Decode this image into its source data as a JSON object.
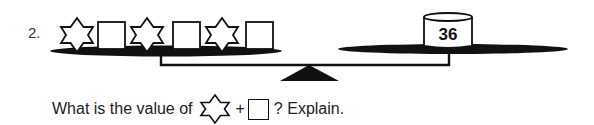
{
  "problem": {
    "number": "2.",
    "left_pan": {
      "items": [
        "star",
        "square",
        "star",
        "square",
        "star",
        "square"
      ]
    },
    "right_pan": {
      "cylinder_label": "36"
    },
    "question": {
      "prefix": "What is the value of",
      "plus": "+",
      "suffix": "? Explain."
    }
  },
  "colors": {
    "ink": "#111111",
    "background": "#ffffff"
  }
}
